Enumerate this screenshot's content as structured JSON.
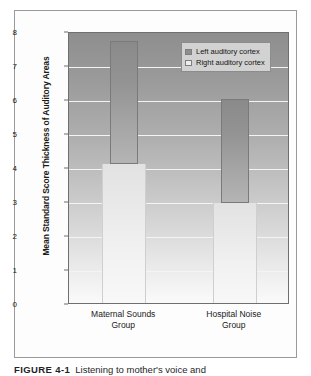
{
  "figure": {
    "caption_number": "FIGURE 4-1",
    "caption_text": "Listening to mother's voice and"
  },
  "chart_data": {
    "type": "bar",
    "title": "",
    "xlabel": "",
    "ylabel": "Mean Standard Score Thickness of Auditory Areas",
    "categories": [
      "Maternal Sounds Group",
      "Hospital Noise Group"
    ],
    "category_lines": [
      [
        "Maternal Sounds",
        "Group"
      ],
      [
        "Hospital Noise",
        "Group"
      ]
    ],
    "series": [
      {
        "name": "Left auditory cortex",
        "values": [
          7.77,
          6.07
        ],
        "color": "#8f8f8f"
      },
      {
        "name": "Right auditory cortex",
        "values": [
          4.15,
          3.0
        ],
        "color": "#ededed"
      }
    ],
    "ylim": [
      0,
      8
    ],
    "yticks": [
      0,
      1,
      2,
      3,
      4,
      5,
      6,
      7,
      8
    ],
    "ytick_labels": [
      "0",
      "1",
      "2",
      "3",
      "4",
      "5",
      "6",
      "7",
      "8"
    ],
    "grid": true,
    "legend_position": "top-right"
  },
  "legend": {
    "items": [
      {
        "label": "Left auditory cortex",
        "swatch": "dark"
      },
      {
        "label": "Right auditory cortex",
        "swatch": "light"
      }
    ]
  }
}
